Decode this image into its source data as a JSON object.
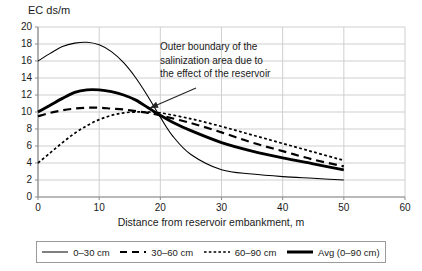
{
  "chart_data": {
    "type": "line",
    "title": "",
    "ylabel": "EC ds/m",
    "xlabel": "Distance from reservoir embankment, m",
    "xlim": [
      0,
      60
    ],
    "ylim": [
      0,
      20
    ],
    "xticks": [
      0,
      10,
      20,
      30,
      40,
      50,
      60
    ],
    "yticks": [
      0,
      2,
      4,
      6,
      8,
      10,
      12,
      14,
      16,
      18,
      20
    ],
    "grid": true,
    "legend_position": "bottom",
    "annotations": [
      {
        "text": "Outer boundary of the salinization area due to the effect of the reservoir",
        "line1": "Outer boundary of the",
        "line2": "salinization area due to",
        "line3": "the effect of the reservoir",
        "arrow_target_x": 17.5,
        "arrow_target_y": 10.0
      }
    ],
    "series": [
      {
        "name": "0–30 cm",
        "style": "solid-thin",
        "x": [
          0,
          2,
          4,
          6,
          8,
          10,
          12,
          14,
          16,
          18,
          20,
          22,
          25,
          30,
          35,
          40,
          45,
          50
        ],
        "values": [
          16.0,
          16.9,
          17.7,
          18.1,
          18.2,
          17.9,
          17.1,
          15.8,
          14.0,
          11.8,
          9.4,
          7.2,
          5.0,
          3.2,
          2.7,
          2.4,
          2.2,
          2.0
        ]
      },
      {
        "name": "30–60 cm",
        "style": "dashed",
        "x": [
          0,
          2,
          4,
          6,
          8,
          10,
          12,
          14,
          16,
          18,
          20,
          25,
          30,
          35,
          40,
          45,
          50
        ],
        "values": [
          9.5,
          9.9,
          10.2,
          10.4,
          10.5,
          10.5,
          10.4,
          10.3,
          10.1,
          9.9,
          9.6,
          8.7,
          7.6,
          6.4,
          5.4,
          4.4,
          3.6
        ]
      },
      {
        "name": "60–90 cm",
        "style": "dotted",
        "x": [
          0,
          2,
          4,
          6,
          8,
          10,
          12,
          14,
          16,
          18,
          20,
          25,
          30,
          35,
          40,
          45,
          50
        ],
        "values": [
          4.0,
          5.2,
          6.4,
          7.5,
          8.4,
          9.1,
          9.6,
          9.9,
          10.0,
          10.0,
          9.9,
          9.2,
          8.3,
          7.3,
          6.3,
          5.3,
          4.3
        ]
      },
      {
        "name": "Avg (0–90 cm)",
        "style": "solid-thick",
        "x": [
          0,
          2,
          4,
          6,
          8,
          10,
          12,
          14,
          16,
          18,
          20,
          22,
          25,
          30,
          35,
          40,
          45,
          50
        ],
        "values": [
          10.0,
          10.8,
          11.6,
          12.3,
          12.6,
          12.6,
          12.4,
          12.0,
          11.4,
          10.5,
          9.6,
          8.8,
          7.8,
          6.4,
          5.4,
          4.6,
          3.9,
          3.2
        ]
      }
    ]
  },
  "ylabel_text": "EC ds/m",
  "xlabel_text": "Distance from reservoir embankment, m",
  "legend": {
    "items": [
      {
        "label": "0–30 cm"
      },
      {
        "label": "30–60 cm"
      },
      {
        "label": "60–90 cm"
      },
      {
        "label": "Avg (0–90 cm)"
      }
    ]
  },
  "annotation": {
    "line1": "Outer boundary of the",
    "line2": "salinization area due to",
    "line3": "the effect of the reservoir"
  },
  "colors": {
    "series_line": "#000000",
    "grid": "#cfcfcf",
    "axis": "#8c8c8c",
    "text": "#1a1a1a",
    "background": "#ffffff"
  }
}
